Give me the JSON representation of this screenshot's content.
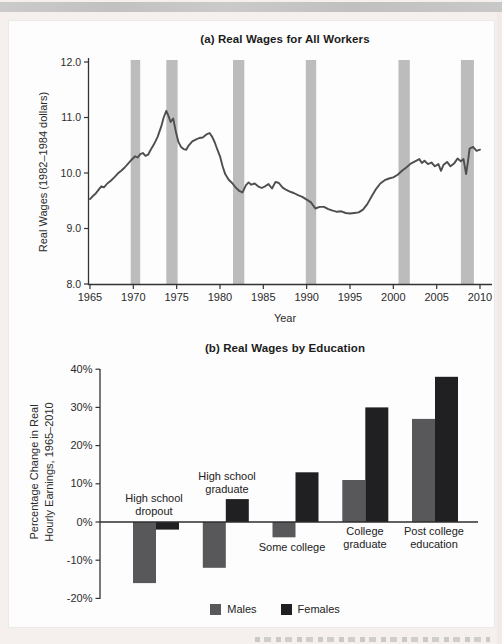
{
  "page": {
    "background_color": "#f5f0ee",
    "edge_strip_color": "#c6c5c5",
    "figure_panel_color": "#fdfdfd",
    "text_color": "#2b2b2b",
    "axis_color": "#333333"
  },
  "chart_data": [
    {
      "type": "line",
      "title": "(a) Real Wages for All Workers",
      "xlabel": "Year",
      "ylabel": "Real Wages (1982–1984 dollars)",
      "xlim": [
        1965,
        2010
      ],
      "ylim": [
        8.0,
        12.0
      ],
      "grid": false,
      "line_color": "#4e4e4e",
      "band_color": "#bcbcbc",
      "x_ticks": {
        "values": [
          1965,
          1970,
          1975,
          1980,
          1985,
          1990,
          1995,
          2000,
          2005,
          2010
        ],
        "labels": [
          "1965",
          "1970",
          "1975",
          "1980",
          "1985",
          "1990",
          "1995",
          "2000",
          "2005",
          "2010"
        ]
      },
      "y_ticks": {
        "values": [
          12,
          11,
          10,
          9,
          8
        ],
        "labels": [
          "12.0",
          "11.0",
          "10.0",
          "9.0",
          "8.0"
        ]
      },
      "recession_bands": [
        [
          1969.7,
          1970.8
        ],
        [
          1973.8,
          1975.1
        ],
        [
          1981.5,
          1982.8
        ],
        [
          1989.9,
          1991.1
        ],
        [
          2000.6,
          2001.9
        ],
        [
          2007.8,
          2009.3
        ]
      ],
      "series": [
        {
          "points": [
            [
              1965.0,
              9.53
            ],
            [
              1965.3,
              9.58
            ],
            [
              1965.6,
              9.62
            ],
            [
              1966.0,
              9.7
            ],
            [
              1966.3,
              9.76
            ],
            [
              1966.6,
              9.74
            ],
            [
              1967.0,
              9.81
            ],
            [
              1967.4,
              9.86
            ],
            [
              1967.8,
              9.92
            ],
            [
              1968.2,
              9.99
            ],
            [
              1968.6,
              10.04
            ],
            [
              1969.0,
              10.1
            ],
            [
              1969.4,
              10.17
            ],
            [
              1969.8,
              10.24
            ],
            [
              1970.2,
              10.3
            ],
            [
              1970.5,
              10.28
            ],
            [
              1970.8,
              10.34
            ],
            [
              1971.1,
              10.36
            ],
            [
              1971.4,
              10.31
            ],
            [
              1971.7,
              10.33
            ],
            [
              1972.0,
              10.42
            ],
            [
              1972.4,
              10.52
            ],
            [
              1972.8,
              10.65
            ],
            [
              1973.2,
              10.83
            ],
            [
              1973.5,
              11.0
            ],
            [
              1973.8,
              11.12
            ],
            [
              1974.0,
              11.05
            ],
            [
              1974.3,
              10.92
            ],
            [
              1974.6,
              10.98
            ],
            [
              1974.9,
              10.75
            ],
            [
              1975.2,
              10.56
            ],
            [
              1975.5,
              10.47
            ],
            [
              1975.8,
              10.43
            ],
            [
              1976.1,
              10.42
            ],
            [
              1976.4,
              10.5
            ],
            [
              1976.8,
              10.57
            ],
            [
              1977.2,
              10.6
            ],
            [
              1977.6,
              10.63
            ],
            [
              1978.0,
              10.64
            ],
            [
              1978.4,
              10.69
            ],
            [
              1978.8,
              10.72
            ],
            [
              1979.1,
              10.65
            ],
            [
              1979.4,
              10.55
            ],
            [
              1979.7,
              10.42
            ],
            [
              1980.0,
              10.3
            ],
            [
              1980.3,
              10.12
            ],
            [
              1980.6,
              9.98
            ],
            [
              1981.0,
              9.88
            ],
            [
              1981.4,
              9.82
            ],
            [
              1981.8,
              9.74
            ],
            [
              1982.2,
              9.68
            ],
            [
              1982.6,
              9.65
            ],
            [
              1983.0,
              9.78
            ],
            [
              1983.3,
              9.83
            ],
            [
              1983.6,
              9.79
            ],
            [
              1984.0,
              9.81
            ],
            [
              1984.4,
              9.76
            ],
            [
              1984.8,
              9.73
            ],
            [
              1985.2,
              9.76
            ],
            [
              1985.6,
              9.8
            ],
            [
              1986.0,
              9.72
            ],
            [
              1986.4,
              9.84
            ],
            [
              1986.8,
              9.82
            ],
            [
              1987.2,
              9.74
            ],
            [
              1987.6,
              9.7
            ],
            [
              1988.0,
              9.67
            ],
            [
              1988.5,
              9.64
            ],
            [
              1989.0,
              9.6
            ],
            [
              1989.5,
              9.57
            ],
            [
              1990.0,
              9.52
            ],
            [
              1990.5,
              9.47
            ],
            [
              1991.0,
              9.36
            ],
            [
              1991.5,
              9.39
            ],
            [
              1992.0,
              9.39
            ],
            [
              1992.5,
              9.35
            ],
            [
              1993.0,
              9.32
            ],
            [
              1993.5,
              9.3
            ],
            [
              1994.0,
              9.31
            ],
            [
              1994.5,
              9.28
            ],
            [
              1995.0,
              9.27
            ],
            [
              1995.5,
              9.28
            ],
            [
              1996.0,
              9.29
            ],
            [
              1996.5,
              9.34
            ],
            [
              1997.0,
              9.44
            ],
            [
              1997.5,
              9.58
            ],
            [
              1998.0,
              9.71
            ],
            [
              1998.5,
              9.81
            ],
            [
              1999.0,
              9.87
            ],
            [
              1999.5,
              9.9
            ],
            [
              2000.0,
              9.92
            ],
            [
              2000.5,
              9.97
            ],
            [
              2001.0,
              10.04
            ],
            [
              2001.5,
              10.1
            ],
            [
              2002.0,
              10.17
            ],
            [
              2002.5,
              10.21
            ],
            [
              2003.0,
              10.25
            ],
            [
              2003.3,
              10.18
            ],
            [
              2003.6,
              10.22
            ],
            [
              2004.0,
              10.16
            ],
            [
              2004.4,
              10.19
            ],
            [
              2004.8,
              10.12
            ],
            [
              2005.2,
              10.16
            ],
            [
              2005.5,
              10.04
            ],
            [
              2005.8,
              10.15
            ],
            [
              2006.2,
              10.2
            ],
            [
              2006.6,
              10.12
            ],
            [
              2007.0,
              10.17
            ],
            [
              2007.4,
              10.26
            ],
            [
              2007.8,
              10.21
            ],
            [
              2008.1,
              10.25
            ],
            [
              2008.4,
              9.98
            ],
            [
              2008.6,
              10.2
            ],
            [
              2008.8,
              10.44
            ],
            [
              2009.2,
              10.47
            ],
            [
              2009.6,
              10.4
            ],
            [
              2010.0,
              10.42
            ]
          ]
        }
      ]
    },
    {
      "type": "bar",
      "title": "(b) Real Wages by Education",
      "ylabel": "Percentage Change in Real Hourly Earnings, 1965–2010",
      "ylabel_lines": [
        "Percentage Change in Real",
        "Hourly Earnings, 1965–2010"
      ],
      "ylim": [
        -20,
        40
      ],
      "grid": false,
      "legend_position": "bottom",
      "categories": [
        "High school dropout",
        "High school graduate",
        "Some college",
        "College graduate",
        "Post college education"
      ],
      "y_ticks": {
        "values": [
          40,
          30,
          20,
          10,
          0,
          -10,
          -20
        ],
        "labels": [
          "40%",
          "30%",
          "20%",
          "10%",
          "0%",
          "-10%",
          "-20%"
        ]
      },
      "series": [
        {
          "name": "Males",
          "color": "#58585a",
          "values": [
            -16,
            -12,
            -4,
            11,
            27
          ]
        },
        {
          "name": "Females",
          "color": "#202023",
          "values": [
            -2,
            6,
            13,
            30,
            38
          ]
        }
      ]
    }
  ]
}
